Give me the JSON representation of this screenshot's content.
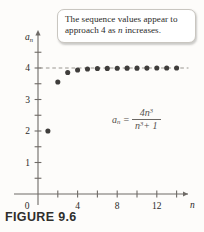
{
  "figure": {
    "caption": "FIGURE 9.6",
    "callout": {
      "line1_prefix": "The sequence values appear to",
      "line2_prefix": "approach 4 as ",
      "line2_var": "n",
      "line2_suffix": " increases."
    },
    "formula": {
      "lhs_base": "a",
      "lhs_sub": "n",
      "equals": "=",
      "numerator_coeff": "4",
      "numerator_var": "n",
      "numerator_exp": "3",
      "denominator_var": "n",
      "denominator_exp": "3",
      "denominator_plus": "+ 1"
    }
  },
  "chart_data": {
    "type": "scatter",
    "title": "",
    "xlabel": "n",
    "ylabel": "a_n",
    "xlim": [
      0,
      15.5
    ],
    "ylim": [
      0,
      4.85
    ],
    "grid": false,
    "legend": null,
    "x_ticks_major": [
      0,
      4,
      8,
      12
    ],
    "x_ticks_major_labels": [
      "0",
      "4",
      "8",
      "12"
    ],
    "x_ticks_minor": [
      2,
      6,
      10,
      14
    ],
    "y_ticks_major": [
      1,
      2,
      3,
      4
    ],
    "y_ticks_major_labels": [
      "1",
      "2",
      "3",
      "4"
    ],
    "y_ticks_minor": [
      0.5,
      1.5,
      2.5,
      3.5,
      4.5
    ],
    "asymptote": {
      "y": 4,
      "style": "dashed",
      "x_start": 0.15,
      "x_end": 15.2,
      "label": "4"
    },
    "x": [
      1,
      2,
      3,
      4,
      5,
      6,
      7,
      8,
      9,
      10,
      11,
      12,
      13,
      14
    ],
    "values": [
      2.0,
      3.556,
      3.857,
      3.938,
      3.968,
      3.982,
      3.988,
      3.992,
      3.995,
      3.996,
      3.997,
      3.998,
      3.998,
      3.999
    ],
    "series": [
      {
        "name": "a_n = 4n^3/(n^3+1)",
        "values": [
          2.0,
          3.556,
          3.857,
          3.938,
          3.968,
          3.982,
          3.988,
          3.992,
          3.995,
          3.996,
          3.997,
          3.998,
          3.998,
          3.999
        ]
      }
    ],
    "point_color": "#3f3d3b",
    "axis_color": "#6e6a66",
    "dash_color": "#9a9690"
  }
}
